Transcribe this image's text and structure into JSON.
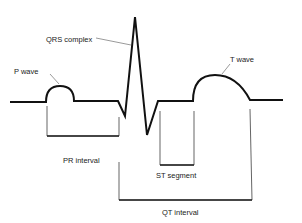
{
  "diagram": {
    "type": "ECG waveform annotation",
    "labels": {
      "p_wave": "P wave",
      "qrs_complex": "QRS complex",
      "t_wave": "T wave",
      "pr_interval": "PR interval",
      "st_segment": "ST segment",
      "qt_interval": "QT interval"
    },
    "colors": {
      "trace": "#111111",
      "leader": "#555555",
      "bracket": "#222222",
      "background": "#ffffff"
    }
  }
}
